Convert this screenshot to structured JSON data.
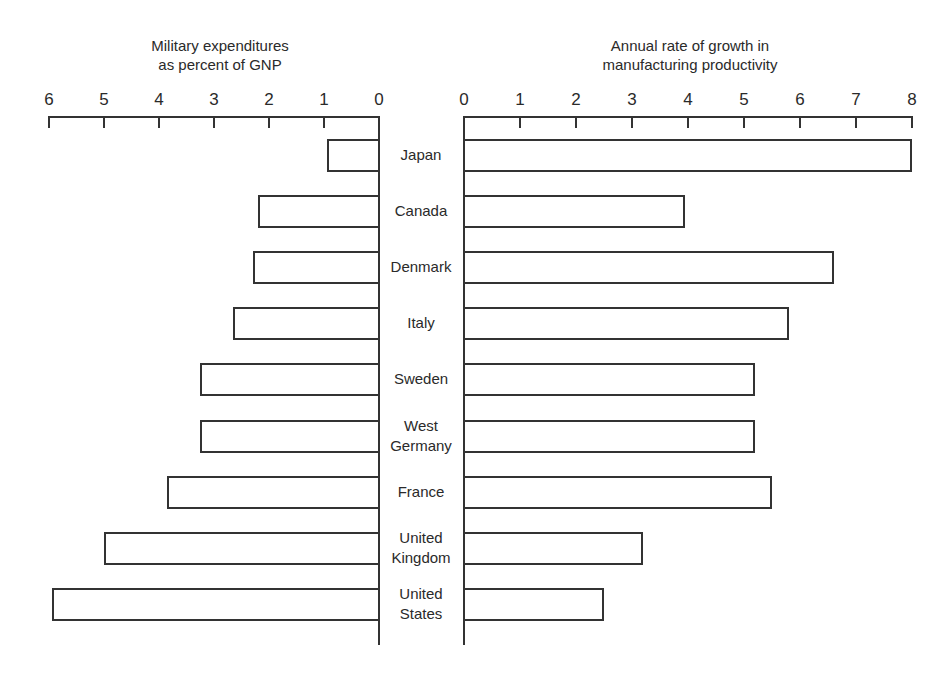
{
  "titles": {
    "left_line1": "Military expenditures",
    "left_line2": "as percent of GNP",
    "right_line1": "Annual rate of growth in",
    "right_line2": "manufacturing productivity"
  },
  "left_ticks": [
    "6",
    "5",
    "4",
    "3",
    "2",
    "1",
    "0"
  ],
  "right_ticks": [
    "0",
    "1",
    "2",
    "3",
    "4",
    "5",
    "6",
    "7",
    "8"
  ],
  "countries": [
    {
      "line1": "Japan",
      "line2": ""
    },
    {
      "line1": "Canada",
      "line2": ""
    },
    {
      "line1": "Denmark",
      "line2": ""
    },
    {
      "line1": "Italy",
      "line2": ""
    },
    {
      "line1": "Sweden",
      "line2": ""
    },
    {
      "line1": "West",
      "line2": "Germany"
    },
    {
      "line1": "France",
      "line2": ""
    },
    {
      "line1": "United",
      "line2": "Kingdom"
    },
    {
      "line1": "United",
      "line2": "States"
    }
  ],
  "chart_data": [
    {
      "type": "bar",
      "orientation": "horizontal",
      "direction": "right-to-left",
      "title": "Military expenditures as percent of GNP",
      "categories": [
        "Japan",
        "Canada",
        "Denmark",
        "Italy",
        "Sweden",
        "West Germany",
        "France",
        "United Kingdom",
        "United States"
      ],
      "values": [
        0.95,
        2.2,
        2.3,
        2.65,
        3.25,
        3.25,
        3.85,
        5.0,
        5.95
      ],
      "xlabel": "Military expenditures as percent of GNP",
      "ylabel": "",
      "xlim": [
        0,
        6
      ],
      "ticks": [
        0,
        1,
        2,
        3,
        4,
        5,
        6
      ],
      "grid": false,
      "legend": null
    },
    {
      "type": "bar",
      "orientation": "horizontal",
      "direction": "left-to-right",
      "title": "Annual rate of growth in manufacturing productivity",
      "categories": [
        "Japan",
        "Canada",
        "Denmark",
        "Italy",
        "Sweden",
        "West Germany",
        "France",
        "United Kingdom",
        "United States"
      ],
      "values": [
        8.0,
        3.95,
        6.6,
        5.8,
        5.2,
        5.2,
        5.5,
        3.2,
        2.5
      ],
      "xlabel": "Annual rate of growth in manufacturing productivity",
      "ylabel": "",
      "xlim": [
        0,
        8
      ],
      "ticks": [
        0,
        1,
        2,
        3,
        4,
        5,
        6,
        7,
        8
      ],
      "grid": false,
      "legend": null
    }
  ]
}
